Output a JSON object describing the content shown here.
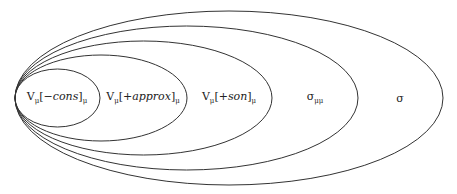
{
  "diagram": {
    "type": "nested-ellipses (Euler diagram)",
    "stroke_color": "#333333",
    "ellipses": [
      {
        "id": "e1",
        "label": {
          "base": "V",
          "sub1": "μ",
          "bracket_open": "[",
          "feature": "−cons",
          "bracket_close": "]",
          "sub2": "μ"
        },
        "cx": 57.5,
        "cy": 98,
        "rx": 42.5,
        "ry": 29,
        "label_x": 57,
        "label_y": 98
      },
      {
        "id": "e2",
        "label": {
          "base": "V",
          "sub1": "μ",
          "bracket_open": "[",
          "feature": "+approx",
          "bracket_close": "]",
          "sub2": "μ"
        },
        "cx": 101,
        "cy": 98,
        "rx": 86,
        "ry": 43,
        "label_x": 143,
        "label_y": 98
      },
      {
        "id": "e3",
        "label": {
          "base": "V",
          "sub1": "μ",
          "bracket_open": "[",
          "feature": "+son",
          "bracket_close": "]",
          "sub2": "μ"
        },
        "cx": 143.5,
        "cy": 98,
        "rx": 128.5,
        "ry": 57,
        "label_x": 229,
        "label_y": 98
      },
      {
        "id": "e4",
        "label": {
          "base": "σ",
          "sub1": "μμ"
        },
        "cx": 186.5,
        "cy": 98,
        "rx": 171.5,
        "ry": 72,
        "label_x": 315,
        "label_y": 98
      },
      {
        "id": "e5",
        "label": {
          "base": "σ"
        },
        "cx": 229,
        "cy": 98,
        "rx": 214,
        "ry": 87,
        "label_x": 400,
        "label_y": 98
      }
    ]
  }
}
